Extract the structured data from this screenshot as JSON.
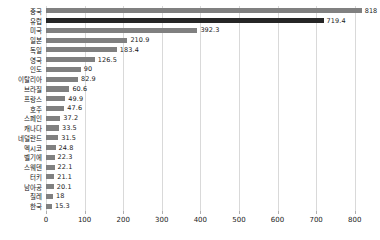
{
  "chart_data": {
    "type": "bar",
    "orientation": "horizontal",
    "title": "",
    "xlabel": "",
    "ylabel": "",
    "xlim": [
      0,
      850
    ],
    "grid": true,
    "legend": null,
    "xticks": [
      0,
      100,
      200,
      300,
      400,
      500,
      600,
      700,
      800
    ],
    "xtick_labels": [
      "0",
      "100",
      "200",
      "300",
      "400",
      "500",
      "600",
      "700",
      "800"
    ],
    "categories": [
      "중국",
      "유럽",
      "미국",
      "일본",
      "독일",
      "영국",
      "인도",
      "이탈리아",
      "브라질",
      "프랑스",
      "호주",
      "스페인",
      "캐나다",
      "네덜란드",
      "멕시코",
      "벨기에",
      "스웨덴",
      "터키",
      "남아공",
      "칠레",
      "한국"
    ],
    "values": [
      818,
      719.4,
      392.3,
      210.9,
      183.4,
      126.5,
      90,
      82.9,
      60.6,
      49.9,
      47.6,
      37.2,
      33.5,
      31.5,
      24.8,
      22.3,
      22.1,
      21.1,
      20.1,
      18,
      15.3
    ],
    "value_labels": [
      "818",
      "719.4",
      "392.3",
      "210.9",
      "183.4",
      "126.5",
      "90",
      "82.9",
      "60.6",
      "49.9",
      "47.6",
      "37.2",
      "33.5",
      "31.5",
      "24.8",
      "22.3",
      "22.1",
      "21.1",
      "20.1",
      "18",
      "15.3"
    ],
    "bar_colors": [
      "#808080",
      "#262626",
      "#808080",
      "#808080",
      "#808080",
      "#808080",
      "#808080",
      "#808080",
      "#808080",
      "#808080",
      "#808080",
      "#808080",
      "#808080",
      "#808080",
      "#808080",
      "#808080",
      "#808080",
      "#808080",
      "#808080",
      "#808080",
      "#808080"
    ],
    "highlight_index": 1,
    "colors": {
      "bar_default": "#808080",
      "bar_highlight": "#262626",
      "grid": "#d9d9d9",
      "text": "#111111",
      "background": "#ffffff"
    }
  }
}
